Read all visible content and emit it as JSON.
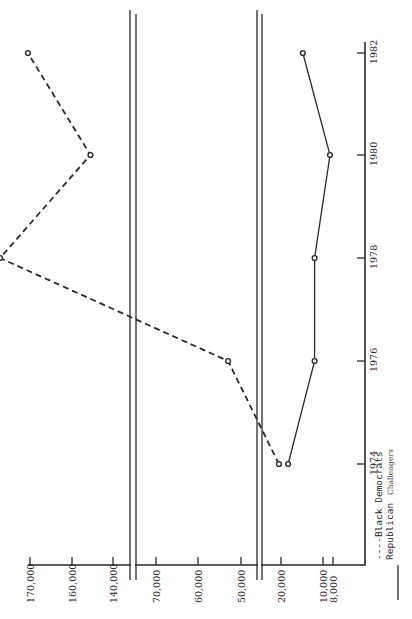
{
  "chart_data": {
    "type": "line",
    "orientation": "rotated-90-ccw",
    "title": "",
    "xlabel": "",
    "ylabel": "",
    "x": [
      1974,
      1976,
      1978,
      1980,
      1982
    ],
    "x_tick_labels": [
      "1974",
      "1976",
      "1978",
      "1980",
      "1982"
    ],
    "y_tick_values": [
      170000,
      160000,
      140000,
      70000,
      60000,
      50000,
      20000,
      10000,
      8000
    ],
    "y_tick_labels": [
      "170,000",
      "160,000",
      "140,000",
      "70,000",
      "60,000",
      "50,000",
      "20,000",
      "10,000",
      "8,000"
    ],
    "axis_breaks": [
      "between 140,000 and 70,000",
      "between 50,000 and 20,000"
    ],
    "grid": false,
    "legend_position": "bottom-right",
    "series": [
      {
        "name": "Black Democrats",
        "style": "dashed",
        "values": [
          20500,
          53000,
          73500,
          151000,
          170500
        ]
      },
      {
        "name": "Republican Challengers",
        "style": "solid",
        "values": [
          18300,
          12000,
          12000,
          8600,
          14800
        ]
      }
    ]
  },
  "legend": {
    "dem_label": "----Black Democrats",
    "rep_label_a": "Republican",
    "rep_label_b": "Challengers"
  }
}
